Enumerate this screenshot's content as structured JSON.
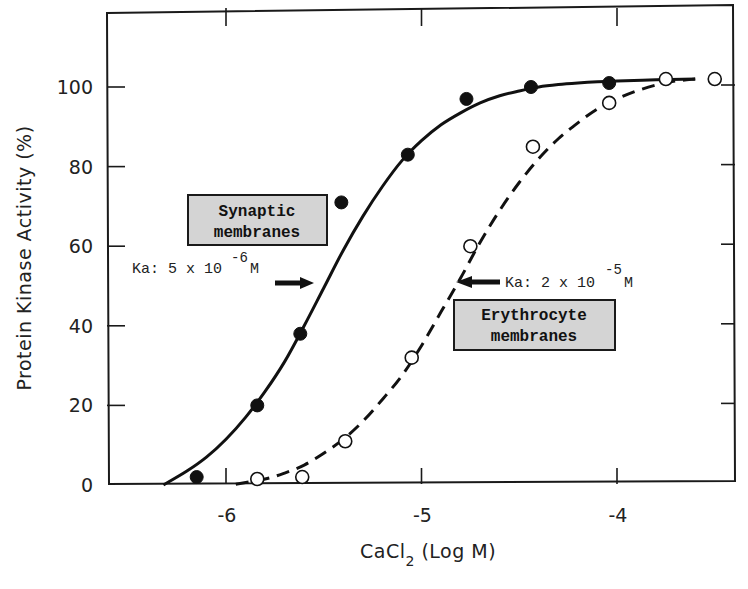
{
  "chart_data": {
    "type": "scatter",
    "title": "",
    "xlabel": "CaCl2 (Log M)",
    "xlabel_main": "CaCl",
    "xlabel_sub": "2",
    "xlabel_rest": " (Log M)",
    "ylabel": "Protein Kinase Activity (%)",
    "xlim": [
      -6.3,
      -3.4
    ],
    "ylim": [
      0,
      115
    ],
    "x_ticks": [
      -6,
      -5,
      -4
    ],
    "x_tick_labels": [
      "-6",
      "-5",
      "-4"
    ],
    "y_ticks": [
      0,
      20,
      40,
      60,
      80,
      100
    ],
    "y_tick_labels": [
      "0",
      "20",
      "40",
      "60",
      "80",
      "100"
    ],
    "grid": false,
    "series": [
      {
        "name": "Synaptic membranes",
        "marker": "filled-circle",
        "line": "solid",
        "x": [
          -6.15,
          -5.84,
          -5.62,
          -5.41,
          -5.07,
          -4.77,
          -4.44,
          -4.04
        ],
        "y": [
          2,
          20,
          38,
          71,
          83,
          97,
          100,
          101
        ],
        "curve_x": [
          -6.32,
          -6.2,
          -6.1,
          -6.0,
          -5.9,
          -5.8,
          -5.7,
          -5.6,
          -5.5,
          -5.4,
          -5.3,
          -5.2,
          -5.1,
          -5.0,
          -4.9,
          -4.8,
          -4.7,
          -4.6,
          -4.5,
          -4.4,
          -4.3,
          -4.2,
          -4.1,
          -4.0,
          -3.8,
          -3.6
        ],
        "curve_y": [
          0,
          3.5,
          7,
          11.5,
          17,
          23.5,
          31,
          40,
          49.5,
          59,
          67.5,
          75,
          81.5,
          86.5,
          90.5,
          93.5,
          96,
          97.8,
          99,
          100,
          100.6,
          101,
          101.3,
          101.5,
          101.8,
          102
        ],
        "ka_label": "Ka: 5 x 10",
        "ka_exp": "-6",
        "ka_unit": "M",
        "ka_x": -5.55,
        "ka_y": 50
      },
      {
        "name": "Erythrocyte membranes",
        "marker": "open-circle",
        "line": "dashed",
        "x": [
          -5.84,
          -5.61,
          -5.39,
          -5.05,
          -4.75,
          -4.43,
          -4.04,
          -3.75,
          -3.5
        ],
        "y": [
          1.5,
          2,
          11,
          32,
          60,
          85,
          96,
          102,
          102
        ],
        "curve_x": [
          -5.95,
          -5.8,
          -5.7,
          -5.6,
          -5.5,
          -5.4,
          -5.3,
          -5.2,
          -5.1,
          -5.0,
          -4.9,
          -4.8,
          -4.7,
          -4.6,
          -4.5,
          -4.4,
          -4.3,
          -4.2,
          -4.1,
          -4.0,
          -3.9,
          -3.8,
          -3.7,
          -3.6
        ],
        "curve_y": [
          0.2,
          1.5,
          3,
          5,
          8,
          11.5,
          16,
          21.5,
          27.5,
          35,
          43.5,
          52,
          61,
          69,
          76,
          82,
          87,
          91,
          94.5,
          97,
          99,
          100.5,
          101.5,
          102
        ],
        "ka_label": "Ka: 2 x 10",
        "ka_exp": "-5",
        "ka_unit": "M",
        "ka_x": -4.82,
        "ka_y": 50
      }
    ],
    "annotations": [
      {
        "text_lines": [
          "Synaptic",
          "membranes"
        ],
        "boxed": true
      },
      {
        "text_lines": [
          "Erythrocyte",
          "membranes"
        ],
        "boxed": true
      }
    ]
  }
}
